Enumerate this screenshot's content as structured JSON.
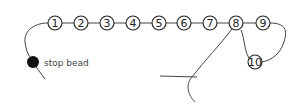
{
  "diagram": {
    "colors": {
      "thread": "#444444",
      "bead_stroke": "#222222",
      "bead_fill": "#ffffff",
      "stop_bead": "#111111"
    },
    "beads": [
      {
        "label": "1",
        "cx": 55,
        "cy": 23
      },
      {
        "label": "2",
        "cx": 81,
        "cy": 23
      },
      {
        "label": "3",
        "cx": 107,
        "cy": 23
      },
      {
        "label": "4",
        "cx": 133,
        "cy": 23
      },
      {
        "label": "5",
        "cx": 159,
        "cy": 23
      },
      {
        "label": "6",
        "cx": 184,
        "cy": 23
      },
      {
        "label": "7",
        "cx": 210,
        "cy": 23
      },
      {
        "label": "8",
        "cx": 236,
        "cy": 23
      },
      {
        "label": "9",
        "cx": 263,
        "cy": 23
      },
      {
        "label": "10",
        "cx": 255,
        "cy": 62
      }
    ],
    "stop_bead": {
      "label": "stop bead",
      "cx": 33,
      "cy": 62
    }
  }
}
